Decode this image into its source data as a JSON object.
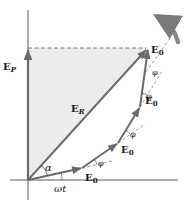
{
  "diagram": {
    "type": "phasor-diagram",
    "colors": {
      "phasor": "#6b6b6b",
      "shading": "#ececec",
      "axis": "#333333",
      "dashed": "#555555",
      "rotation_arrow": "#8a8a8a"
    },
    "labels": {
      "ep_main": "E",
      "ep_sub": "P",
      "er_main": "E",
      "er_sub": "R",
      "e0_main": "E",
      "e0_sub": "0",
      "alpha": "α",
      "phi": "φ",
      "omega_t": "ωt"
    },
    "phasors": [
      {
        "name": "E_0",
        "from": [
          28,
          180
        ],
        "to": [
          82,
          168
        ]
      },
      {
        "name": "E_0",
        "from": [
          82,
          168
        ],
        "to": [
          118,
          143
        ]
      },
      {
        "name": "E_0",
        "from": [
          118,
          143
        ],
        "to": [
          140,
          107
        ]
      },
      {
        "name": "E_0",
        "from": [
          140,
          107
        ],
        "to": [
          148,
          48
        ]
      }
    ],
    "resultant": {
      "name": "E_R",
      "from": [
        28,
        180
      ],
      "to": [
        148,
        48
      ]
    },
    "projection": {
      "name": "E_P",
      "from": [
        28,
        180
      ],
      "to": [
        28,
        48
      ]
    },
    "angles": [
      "ωt",
      "α",
      "φ",
      "φ",
      "φ"
    ],
    "rotation": "counterclockwise"
  }
}
